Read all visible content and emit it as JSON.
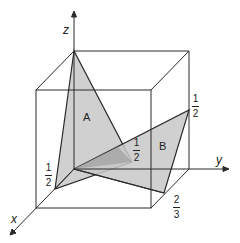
{
  "axes": {
    "x_label": "x",
    "y_label": "y",
    "z_label": "z"
  },
  "planes": {
    "a_label": "A",
    "b_label": "B"
  },
  "intercepts": {
    "a_x": {
      "num": "1",
      "den": "2"
    },
    "a_y": {
      "num": "1",
      "den": "2"
    },
    "b_z": {
      "num": "1",
      "den": "2"
    },
    "b_x": {
      "num": "2",
      "den": "3"
    }
  },
  "colors": {
    "plane_fill": "#c8c8c8",
    "overlap_fill": "#a9a9a9",
    "line": "#2a2a2a"
  }
}
